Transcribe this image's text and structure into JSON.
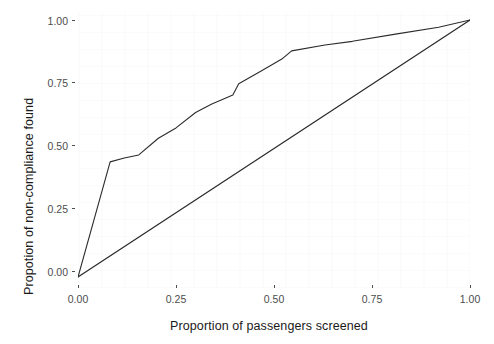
{
  "chart_data": {
    "type": "line",
    "title": "",
    "subtitle": "",
    "xlabel": "Proportion of passengers screened",
    "ylabel": "Propotion of non-compliance found",
    "xlim": [
      0.0,
      1.0
    ],
    "ylim": [
      0.0,
      1.0
    ],
    "xticks": [
      0.0,
      0.25,
      0.5,
      0.75,
      1.0
    ],
    "yticks": [
      0.0,
      0.25,
      0.5,
      0.75,
      1.0
    ],
    "xticklabels": [
      "0.00",
      "0.25",
      "0.50",
      "0.75",
      "1.00"
    ],
    "yticklabels": [
      "0.00",
      "0.25",
      "0.50",
      "0.75",
      "1.00"
    ],
    "grid": false,
    "legend": "none",
    "line_color": "#2b2b2b",
    "line_width": 1.1,
    "series": [
      {
        "name": "Cumulative non-compliance found",
        "type": "line",
        "points": [
          [
            0.0,
            0.0
          ],
          [
            0.082,
            0.448
          ],
          [
            0.118,
            0.463
          ],
          [
            0.155,
            0.475
          ],
          [
            0.205,
            0.54
          ],
          [
            0.25,
            0.58
          ],
          [
            0.3,
            0.64
          ],
          [
            0.34,
            0.672
          ],
          [
            0.395,
            0.708
          ],
          [
            0.41,
            0.752
          ],
          [
            0.465,
            0.8
          ],
          [
            0.52,
            0.848
          ],
          [
            0.545,
            0.88
          ],
          [
            0.63,
            0.903
          ],
          [
            0.7,
            0.917
          ],
          [
            0.81,
            0.945
          ],
          [
            0.92,
            0.972
          ],
          [
            1.0,
            1.0
          ]
        ]
      },
      {
        "name": "Random baseline",
        "type": "line",
        "points": [
          [
            -0.035,
            -0.035
          ],
          [
            0.0,
            0.0
          ],
          [
            1.0,
            1.0
          ],
          [
            1.035,
            1.035
          ]
        ]
      }
    ],
    "annotations": []
  },
  "axes": {
    "x_title": "Proportion of passengers screened",
    "y_title": "Propotion of non-compliance found",
    "x_tick_labels": [
      "0.00",
      "0.25",
      "0.50",
      "0.75",
      "1.00"
    ],
    "y_tick_labels": [
      "0.00",
      "0.25",
      "0.50",
      "0.75",
      "1.00"
    ]
  },
  "style": {
    "background": "#ffffff",
    "panel_background": "#ffffff",
    "ink": "#2b2b2b",
    "tick_color": "#4d4d4d"
  }
}
